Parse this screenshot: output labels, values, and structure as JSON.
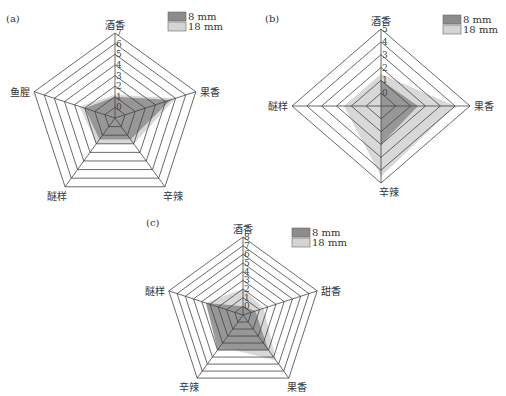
{
  "colors": {
    "series_8mm": "#8c8c8c",
    "series_18mm": "#d4d4d4",
    "grid": "#444444"
  },
  "chart_data": [
    {
      "type": "radar",
      "panel": "(a)",
      "axes": [
        "酒香",
        "果香",
        "辛辣",
        "醚样",
        "鱼腥"
      ],
      "ticks": [
        "0",
        "1",
        "2",
        "3",
        "4",
        "5",
        "6",
        "7"
      ],
      "range": [
        -1,
        7
      ],
      "series": [
        {
          "name": "8 mm",
          "values": [
            1,
            4.5,
            1.5,
            1.5,
            2
          ]
        },
        {
          "name": "18 mm",
          "values": [
            1.2,
            5,
            2,
            2,
            2.5
          ]
        }
      ],
      "legend": [
        "8 mm",
        "18 mm"
      ],
      "legend_position": "top-right"
    },
    {
      "type": "radar",
      "panel": "(b)",
      "axes": [
        "酒香",
        "果香",
        "辛辣",
        "醚样"
      ],
      "ticks": [
        "0",
        "1",
        "2",
        "3",
        "4",
        "5"
      ],
      "range": [
        -1,
        5
      ],
      "series": [
        {
          "name": "8 mm",
          "values": [
            1,
            1.5,
            2,
            -1
          ]
        },
        {
          "name": "18 mm",
          "values": [
            1.5,
            4,
            4.5,
            1.5
          ]
        }
      ],
      "legend": [
        "8 mm",
        "18 mm"
      ],
      "legend_position": "top-right"
    },
    {
      "type": "radar",
      "panel": "(c)",
      "axes": [
        "酒香",
        "甜香",
        "果香",
        "辛辣",
        "醚样"
      ],
      "ticks": [
        "0",
        "1",
        "2",
        "3",
        "4",
        "5",
        "6",
        "7",
        "8"
      ],
      "range": [
        -1,
        8
      ],
      "series": [
        {
          "name": "8 mm",
          "values": [
            0,
            0.5,
            4,
            4,
            3.5
          ]
        },
        {
          "name": "18 mm",
          "values": [
            2,
            1.5,
            5.5,
            3.5,
            3.5
          ]
        }
      ],
      "legend": [
        "8 mm",
        "18 mm"
      ],
      "legend_position": "top-right"
    }
  ],
  "layout": [
    {
      "cx": 115,
      "cy": 118,
      "rx": 85,
      "ry": 85,
      "legend_x": 168,
      "legend_y": 12,
      "panel_x": 6,
      "panel_y": 22
    },
    {
      "cx": 381,
      "cy": 106,
      "rx": 89,
      "ry": 77,
      "legend_x": 443,
      "legend_y": 15,
      "panel_x": 265,
      "panel_y": 22
    },
    {
      "cx": 243,
      "cy": 315,
      "rx": 78,
      "ry": 78,
      "legend_x": 292,
      "legend_y": 228,
      "panel_x": 146,
      "panel_y": 226
    }
  ]
}
